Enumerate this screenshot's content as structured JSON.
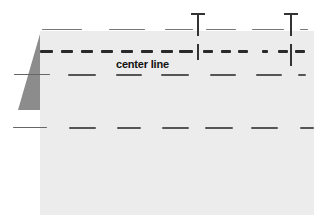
{
  "diagram": {
    "labels": {
      "center_line": "center line"
    },
    "colors": {
      "background": "#ffffff",
      "panel": "#ececec",
      "wedge": "#8c8c8c",
      "dash_dark": "#2a2a2a",
      "dash_mid": "#555555",
      "marker": "#333333"
    },
    "rows": [
      {
        "name": "top-edge-line",
        "y": 30,
        "style": "thin"
      },
      {
        "name": "center-line",
        "y": 50,
        "style": "bold"
      },
      {
        "name": "upper-lane-line",
        "y": 74,
        "style": "mid"
      },
      {
        "name": "lower-lane-line",
        "y": 127,
        "style": "mid"
      }
    ],
    "markers": [
      {
        "name": "marker-post-1",
        "x": 197
      },
      {
        "name": "marker-post-2",
        "x": 290
      }
    ]
  }
}
